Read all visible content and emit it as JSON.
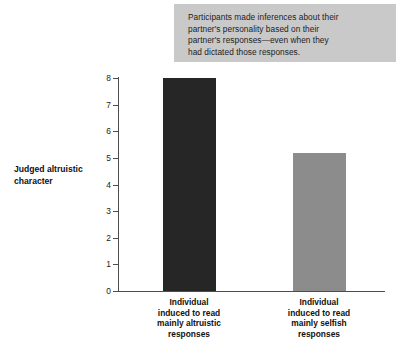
{
  "callout": {
    "lines": [
      "Participants made inferences about their",
      "partner's personality based on their",
      "partner's responses—even when they",
      "had dictated those responses."
    ],
    "background_color": "#c9c9c9"
  },
  "chart_data": {
    "type": "bar",
    "title": "",
    "xlabel": "",
    "ylabel": "Judged altruistic character",
    "ylim": [
      0,
      8
    ],
    "yticks": [
      0,
      1,
      2,
      3,
      4,
      5,
      6,
      7,
      8
    ],
    "ytick_labels": [
      "0",
      "1",
      "2",
      "3",
      "4",
      "5",
      "6",
      "7",
      "8"
    ],
    "grid": false,
    "legend": "none",
    "categories": [
      "Individual induced to read mainly altruistic responses",
      "Individual induced to read mainly selfish responses"
    ],
    "category_label_lines": [
      [
        "Individual",
        "induced to read",
        "mainly altruistic",
        "responses"
      ],
      [
        "Individual",
        "induced to read",
        "mainly selfish",
        "responses"
      ]
    ],
    "values": [
      8.0,
      5.2
    ],
    "bar_colors": [
      "#262626",
      "#8c8c8c"
    ]
  }
}
